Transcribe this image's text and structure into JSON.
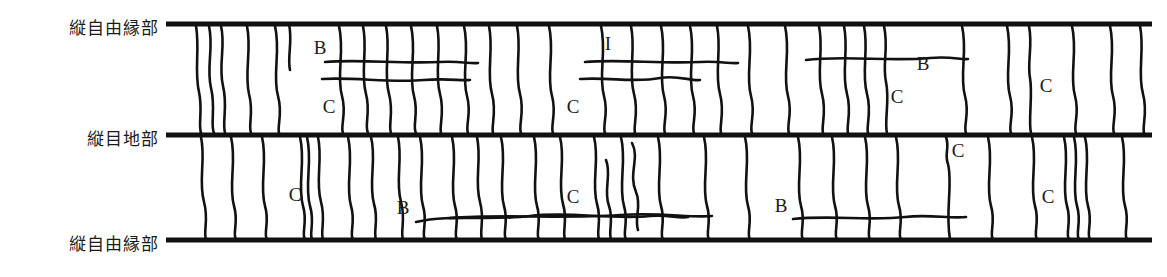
{
  "figure": {
    "title": "",
    "type": "crack-map-diagram",
    "width": 1167,
    "height": 277,
    "background": "#ffffff",
    "ink_color": "#111111"
  },
  "row_labels": [
    {
      "id": "top-free-edge",
      "text": "縦自由縁部",
      "y": 24
    },
    {
      "id": "middle-joint",
      "text": "縦目地部",
      "y": 135
    },
    {
      "id": "bottom-free-edge",
      "text": "縦自由縁部",
      "y": 240
    }
  ],
  "boundaries": {
    "x_start": 166,
    "x_end": 1152,
    "thickness": 5,
    "lines_y": [
      24,
      135,
      240
    ]
  },
  "bands": [
    {
      "id": "upper-band",
      "top": 24,
      "bottom": 135
    },
    {
      "id": "lower-band",
      "top": 135,
      "bottom": 240
    }
  ],
  "crack_codes": [
    {
      "label": "B",
      "x": 320,
      "y": 54,
      "band": "upper-band"
    },
    {
      "label": "C",
      "x": 329,
      "y": 113,
      "band": "upper-band"
    },
    {
      "label": "I",
      "x": 608,
      "y": 50,
      "band": "upper-band"
    },
    {
      "label": "C",
      "x": 573,
      "y": 113,
      "band": "upper-band"
    },
    {
      "label": "B",
      "x": 923,
      "y": 70,
      "band": "upper-band"
    },
    {
      "label": "C",
      "x": 897,
      "y": 103,
      "band": "upper-band"
    },
    {
      "label": "C",
      "x": 1046,
      "y": 92,
      "band": "upper-band"
    },
    {
      "label": "C",
      "x": 295,
      "y": 201,
      "band": "lower-band"
    },
    {
      "label": "B",
      "x": 403,
      "y": 214,
      "band": "lower-band"
    },
    {
      "label": "C",
      "x": 573,
      "y": 203,
      "band": "lower-band"
    },
    {
      "label": "B",
      "x": 781,
      "y": 212,
      "band": "lower-band"
    },
    {
      "label": "C",
      "x": 958,
      "y": 157,
      "band": "lower-band"
    },
    {
      "label": "C",
      "x": 1048,
      "y": 203,
      "band": "lower-band"
    }
  ],
  "transverse_cracks_upper": [
    "M 196 26 C 200 50, 194 70, 199 92 C 203 110, 198 124, 201 133",
    "M 209 26 C 214 48, 206 66, 211 88 C 216 108, 210 124, 214 133",
    "M 221 26 C 226 46, 218 64, 223 86 C 228 106, 222 122, 225 133",
    "M 247 26 C 252 50, 244 72, 249 94 C 254 112, 248 126, 251 133",
    "M 275 26 C 281 52, 272 74, 278 96 C 283 114, 277 126, 279 133",
    "M 289 24 C 293 42, 287 56, 290 70",
    "M 339 26 C 345 52, 336 74, 342 96 C 347 114, 340 126, 343 133",
    "M 363 26 C 368 50, 360 72, 366 94 C 371 112, 364 126, 368 133",
    "M 386 26 C 391 50, 383 72, 389 94 C 394 112, 388 126, 391 133",
    "M 411 26 C 417 52, 408 74, 414 96 C 419 114, 412 126, 416 133",
    "M 437 26 C 442 50, 434 72, 440 94 C 445 112, 439 126, 441 133",
    "M 464 26 C 470 52, 461 74, 467 96 C 472 114, 465 126, 468 133",
    "M 489 26 C 494 50, 486 72, 492 94 C 497 112, 491 126, 493 133",
    "M 517 26 C 522 50, 514 72, 520 94 C 525 112, 518 126, 521 133",
    "M 549 26 C 555 52, 546 74, 552 96 C 557 114, 550 126, 553 133",
    "M 601 26 C 607 52, 598 74, 604 96 C 609 114, 602 126, 605 133",
    "M 631 26 C 636 50, 628 72, 634 94 C 639 112, 633 126, 635 133",
    "M 661 26 C 667 52, 658 74, 664 96 C 669 114, 662 126, 665 133",
    "M 690 26 C 696 52, 687 74, 693 96 C 698 114, 691 126, 694 133",
    "M 717 26 C 722 50, 714 72, 720 94 C 725 112, 719 126, 721 133",
    "M 748 26 C 754 52, 745 74, 751 96 C 756 114, 749 126, 752 133",
    "M 785 26 C 791 52, 782 74, 788 96 C 793 114, 786 126, 789 133",
    "M 819 26 C 824 50, 816 72, 822 94 C 827 112, 821 126, 823 133",
    "M 844 26 C 849 50, 841 72, 847 94 C 852 112, 846 126, 848 133",
    "M 864 26 C 869 50, 861 72, 867 94 C 872 112, 866 126, 868 133",
    "M 884 26 C 889 48, 882 64, 886 82 C 890 100, 884 122, 887 133",
    "M 962 26 C 968 52, 959 74, 965 96 C 970 114, 963 126, 966 133",
    "M 1007 26 C 1013 52, 1004 74, 1010 96 C 1015 114, 1008 126, 1011 133",
    "M 1029 26 C 1033 46, 1027 62, 1030 78 C 1033 94, 1028 122, 1031 133",
    "M 1072 26 C 1078 52, 1069 74, 1075 96 C 1080 114, 1073 126, 1076 133",
    "M 1110 26 C 1116 52, 1107 74, 1113 96 C 1118 114, 1111 126, 1114 133",
    "M 1140 26 C 1145 50, 1137 72, 1143 94 C 1148 112, 1142 126, 1144 133"
  ],
  "longitudinal_cracks_upper": [
    "M 325 62 C 360 59, 400 64, 440 62 C 462 61, 470 64, 478 63",
    "M 322 79 C 355 77, 390 83, 424 80 C 448 78, 460 81, 470 80",
    "M 585 62 C 620 59, 660 64, 700 62 C 722 61, 730 64, 738 63",
    "M 580 79 C 610 77, 635 83, 660 78 C 678 75, 690 81, 700 80",
    "M 806 60 C 845 55, 890 62, 930 58 C 952 56, 960 60, 968 59"
  ],
  "transverse_cracks_lower": [
    "M 201 137 C 206 160, 198 180, 204 202 C 209 220, 203 232, 206 239",
    "M 231 137 C 237 162, 228 184, 234 206 C 239 222, 232 234, 236 239",
    "M 262 137 C 268 162, 259 184, 265 206 C 270 222, 263 234, 267 239",
    "M 300 137 C 306 162, 297 184, 303 206 C 308 222, 301 234, 305 239",
    "M 307 137 C 313 162, 304 184, 310 206 C 315 222, 309 234, 312 239",
    "M 318 137 C 323 160, 315 180, 321 202 C 326 220, 320 232, 323 239",
    "M 348 137 C 354 162, 345 184, 351 206 C 356 222, 349 234, 353 239",
    "M 371 137 C 377 160, 368 182, 374 204 C 379 220, 373 232, 376 239",
    "M 398 137 C 403 160, 395 180, 401 202 C 406 220, 400 232, 403 239",
    "M 420 137 C 426 162, 417 184, 423 206 C 428 222, 421 234, 425 239",
    "M 452 137 C 458 162, 449 184, 455 206 C 460 222, 453 234, 457 239",
    "M 477 137 C 482 160, 474 180, 480 202 C 485 220, 479 232, 482 239",
    "M 501 137 C 507 162, 498 184, 504 206 C 509 222, 502 234, 506 239",
    "M 534 137 C 540 162, 531 184, 537 206 C 542 222, 535 234, 539 239",
    "M 560 137 C 566 160, 557 182, 563 204 C 568 220, 562 232, 565 239",
    "M 594 137 C 600 160, 591 182, 597 204 C 602 220, 596 232, 599 239",
    "M 606 160 C 612 175, 603 190, 609 206 C 614 220, 608 232, 611 239",
    "M 621 137 C 627 162, 618 184, 624 206 C 629 222, 622 234, 626 239",
    "M 632 143 C 640 158, 628 174, 636 192 C 642 206, 634 218, 638 230",
    "M 658 137 C 664 162, 655 184, 661 206 C 666 222, 659 234, 663 239",
    "M 704 137 C 710 162, 701 184, 707 206 C 712 222, 705 234, 709 239",
    "M 745 137 C 751 162, 742 184, 748 206 C 753 222, 746 234, 750 239",
    "M 798 137 C 804 162, 795 184, 801 206 C 806 222, 799 234, 803 239",
    "M 832 137 C 838 162, 829 184, 835 206 C 840 222, 833 234, 837 239",
    "M 865 137 C 871 162, 862 184, 868 206 C 873 222, 866 234, 870 239",
    "M 896 137 C 902 162, 893 184, 899 206 C 904 222, 897 234, 901 239",
    "M 946 137 C 950 148, 944 154, 948 164 C 953 184, 945 212, 950 239",
    "M 988 137 C 994 162, 985 184, 991 206 C 996 222, 989 234, 993 239",
    "M 1032 137 C 1038 162, 1029 184, 1035 206 C 1040 222, 1033 234, 1037 239",
    "M 1064 137 C 1070 162, 1061 184, 1067 206 C 1072 222, 1065 234, 1069 239",
    "M 1074 137 C 1080 162, 1071 184, 1077 206 C 1082 222, 1075 234, 1079 239",
    "M 1085 137 C 1091 162, 1082 184, 1088 206 C 1093 222, 1086 234, 1090 239",
    "M 1122 137 C 1128 162, 1119 184, 1125 206 C 1130 222, 1123 234, 1127 239"
  ],
  "longitudinal_cracks_lower": [
    "M 416 222 C 450 214, 490 221, 530 216 C 570 211, 610 220, 650 216 C 668 214, 678 219, 688 217",
    "M 450 218 C 500 214, 560 219, 620 215 C 660 212, 690 218, 712 216",
    "M 793 219 C 830 215, 870 221, 905 217 C 930 214, 950 219, 966 217"
  ]
}
